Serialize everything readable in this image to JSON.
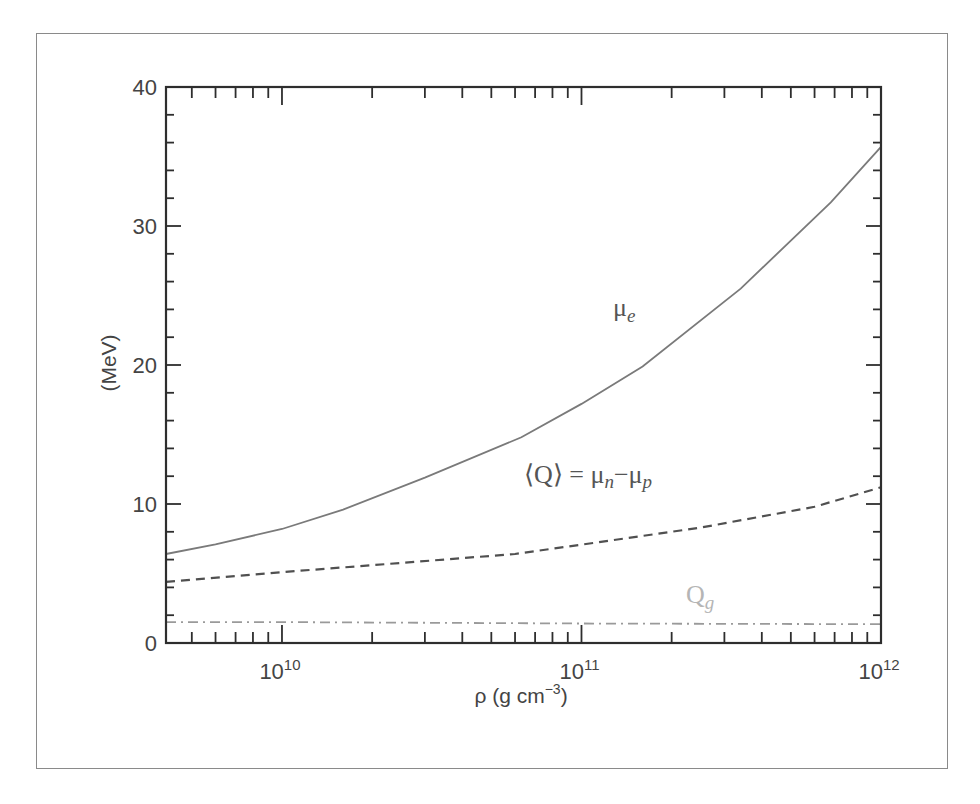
{
  "figure": {
    "frame_color": "#8a8a8a",
    "caption_visible": "truncated"
  },
  "chart_data": {
    "type": "line",
    "title": "",
    "xlabel": "ρ (g cm⁻³)",
    "xlabel_parts": {
      "main": "ρ (g cm",
      "sup": "−3",
      "tail": ")"
    },
    "ylabel": "(MeV)",
    "xscale": "log",
    "xlim": [
      4100000000.0,
      1000000000000.0
    ],
    "ylim": [
      0,
      40
    ],
    "grid": false,
    "legend": "inline labels",
    "x_ticks": [
      {
        "value": 10000000000.0,
        "base": "10",
        "exp": "10"
      },
      {
        "value": 100000000000.0,
        "base": "10",
        "exp": "11"
      },
      {
        "value": 1000000000000.0,
        "base": "10",
        "exp": "12"
      }
    ],
    "y_ticks": [
      0,
      10,
      20,
      30,
      40
    ],
    "y_minor_step": 2,
    "series": [
      {
        "name": "μe",
        "label_main": "μ",
        "label_sub": "e",
        "style": "solid",
        "color": "#7a7a7a",
        "label_pos": {
          "x": 613,
          "y": 316
        },
        "x": [
          4100000000.0,
          6000000000.0,
          10000000000.0,
          16000000000.0,
          30000000000.0,
          63000000000.0,
          100000000000.0,
          160000000000.0,
          340000000000.0,
          680000000000.0,
          1000000000000.0
        ],
        "y": [
          6.4,
          7.1,
          8.2,
          9.6,
          11.9,
          14.8,
          17.2,
          19.9,
          25.5,
          31.7,
          35.7
        ]
      },
      {
        "name": "⟨Q⟩ = μn−μp",
        "label_main": "⟨Q⟩ = μ",
        "label_sub1": "n",
        "label_mid": "−μ",
        "label_sub2": "p",
        "style": "dashed",
        "color": "#505050",
        "label_pos": {
          "x": 524,
          "y": 483
        },
        "x": [
          4100000000.0,
          10000000000.0,
          20000000000.0,
          60000000000.0,
          110000000000.0,
          250000000000.0,
          600000000000.0,
          1000000000000.0
        ],
        "y": [
          4.4,
          5.1,
          5.6,
          6.4,
          7.2,
          8.3,
          9.8,
          11.2
        ]
      },
      {
        "name": "Qg",
        "label_main": "Q",
        "label_sub": "g",
        "style": "dashdot",
        "color": "#9a9a9a",
        "label_color": "#b5b5b5",
        "label_pos": {
          "x": 686,
          "y": 603
        },
        "x": [
          4100000000.0,
          10000000000.0,
          100000000000.0,
          1000000000000.0
        ],
        "y": [
          1.5,
          1.5,
          1.4,
          1.35
        ]
      }
    ]
  }
}
